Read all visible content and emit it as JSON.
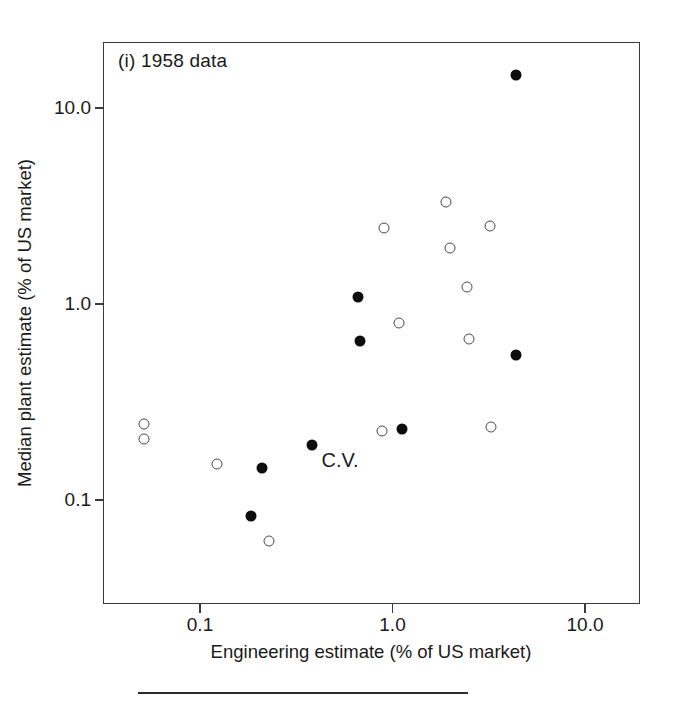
{
  "figure": {
    "panel_title": "(i) 1958 data",
    "background": "#ffffff",
    "frame_color": "#3a3a3a"
  },
  "annotations": [
    {
      "text": "C.V.",
      "x": 0.38,
      "y": 0.175
    }
  ],
  "chart_data": {
    "type": "scatter",
    "title": "(i) 1958 data",
    "xlabel": "Engineering estimate (% of US market)",
    "ylabel": "Median plant estimate (% of US market)",
    "xscale": "log",
    "yscale": "log",
    "xlim": [
      0.042,
      17.0
    ],
    "ylim": [
      0.044,
      19.0
    ],
    "xticks": [
      0.1,
      1.0,
      10.0
    ],
    "xticklabels": [
      "0.1",
      "1.0",
      "10.0"
    ],
    "yticks": [
      0.1,
      1.0,
      10.0
    ],
    "yticklabels": [
      "0.1",
      "1.0",
      "10.0"
    ],
    "grid": false,
    "legend": null,
    "series": [
      {
        "name": "filled",
        "marker": "filled-circle",
        "color": "#0d0d0d",
        "points": [
          {
            "x": 4.4,
            "y": 14.7
          },
          {
            "x": 0.66,
            "y": 1.09
          },
          {
            "x": 0.68,
            "y": 0.65
          },
          {
            "x": 4.4,
            "y": 0.55
          },
          {
            "x": 1.12,
            "y": 0.23
          },
          {
            "x": 0.38,
            "y": 0.19
          },
          {
            "x": 0.21,
            "y": 0.145
          },
          {
            "x": 0.185,
            "y": 0.083
          }
        ]
      },
      {
        "name": "open",
        "marker": "open-circle",
        "color": "#4a4a4a",
        "points": [
          {
            "x": 1.9,
            "y": 3.3
          },
          {
            "x": 0.9,
            "y": 2.45
          },
          {
            "x": 2.0,
            "y": 1.93
          },
          {
            "x": 3.2,
            "y": 2.5
          },
          {
            "x": 2.45,
            "y": 1.22
          },
          {
            "x": 1.08,
            "y": 0.8
          },
          {
            "x": 2.5,
            "y": 0.66
          },
          {
            "x": 0.88,
            "y": 0.225
          },
          {
            "x": 3.25,
            "y": 0.235
          },
          {
            "x": 0.051,
            "y": 0.245
          },
          {
            "x": 0.051,
            "y": 0.205
          },
          {
            "x": 0.122,
            "y": 0.152
          },
          {
            "x": 0.227,
            "y": 0.062
          }
        ]
      }
    ]
  }
}
